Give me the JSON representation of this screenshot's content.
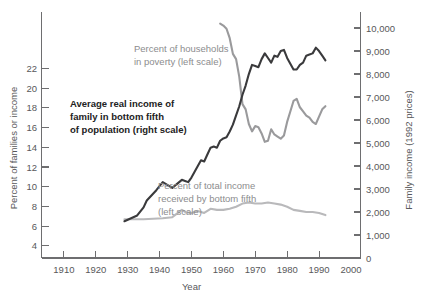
{
  "chart_data": {
    "type": "line",
    "title": "",
    "xlabel": "Year",
    "ylabel": "Percent of families or income",
    "ylabel_right": "Family income (1992 prices)",
    "xlim": [
      1903,
      2003
    ],
    "ylim": [
      0,
      23.5
    ],
    "ylim_right": [
      0,
      10700
    ],
    "grid": false,
    "legend": "annotations-inline",
    "x_ticks": [
      1910,
      1920,
      1930,
      1940,
      1950,
      1960,
      1970,
      1980,
      1990,
      2000
    ],
    "x_tick_labels": [
      "1910",
      "1920",
      "1930",
      "1940",
      "1950",
      "1960",
      "1970",
      "1980",
      "1990",
      "2000"
    ],
    "y_ticks_left": [
      4,
      6,
      8,
      10,
      12,
      14,
      16,
      18,
      20,
      22
    ],
    "y_tick_labels_left": [
      "4",
      "6",
      "8",
      "10",
      "12",
      "14",
      "16",
      "18",
      "20",
      "22"
    ],
    "y_ticks_right": [
      0,
      1000,
      2000,
      3000,
      4000,
      5000,
      6000,
      7000,
      8000,
      9000,
      10000
    ],
    "y_tick_labels_right": [
      "0",
      "1,000",
      "2,000",
      "3,000",
      "4,000",
      "5,000",
      "6,000",
      "7,000",
      "8,000",
      "9,000",
      "10,000"
    ],
    "series": [
      {
        "name": "Average real income of family in bottom fifth of population",
        "scale": "right",
        "units": "1992 dollars",
        "color": "#3a3a3c",
        "x": [
          1929,
          1933,
          1935,
          1936,
          1939,
          1941,
          1944,
          1947,
          1948,
          1949,
          1950,
          1951,
          1952,
          1953,
          1954,
          1955,
          1956,
          1957,
          1958,
          1959,
          1960,
          1961,
          1962,
          1963,
          1964,
          1965,
          1966,
          1967,
          1968,
          1969,
          1970,
          1971,
          1972,
          1973,
          1974,
          1975,
          1976,
          1977,
          1978,
          1979,
          1980,
          1981,
          1982,
          1983,
          1984,
          1985,
          1986,
          1987,
          1988,
          1989,
          1990,
          1991,
          1992
        ],
        "y": [
          1600,
          1850,
          2200,
          2500,
          2950,
          3300,
          3050,
          3400,
          3350,
          3300,
          3500,
          3750,
          4000,
          4250,
          4200,
          4500,
          4800,
          4850,
          4800,
          5100,
          5200,
          5250,
          5500,
          5800,
          6200,
          6600,
          7100,
          7500,
          8000,
          8400,
          8350,
          8300,
          8650,
          8900,
          8700,
          8500,
          8800,
          8750,
          9000,
          9050,
          8700,
          8450,
          8200,
          8200,
          8400,
          8500,
          8800,
          8850,
          8900,
          9150,
          9000,
          8800,
          8600
        ]
      },
      {
        "name": "Percent of households in poverty",
        "scale": "left",
        "units": "percent",
        "color": "#9a9a9c",
        "x": [
          1959,
          1960,
          1961,
          1962,
          1963,
          1964,
          1965,
          1966,
          1967,
          1968,
          1969,
          1970,
          1971,
          1972,
          1973,
          1974,
          1975,
          1976,
          1977,
          1978,
          1979,
          1980,
          1981,
          1982,
          1983,
          1984,
          1985,
          1986,
          1987,
          1988,
          1989,
          1990,
          1991,
          1992
        ],
        "y": [
          22.4,
          22.2,
          21.9,
          21.0,
          19.5,
          19.0,
          17.3,
          14.7,
          14.2,
          12.8,
          12.1,
          12.6,
          12.5,
          11.9,
          11.1,
          11.2,
          12.3,
          11.8,
          11.6,
          11.4,
          11.7,
          13.0,
          14.0,
          15.0,
          15.2,
          14.4,
          14.0,
          13.6,
          13.4,
          13.0,
          12.8,
          13.5,
          14.2,
          14.5
        ]
      },
      {
        "name": "Percent of total income received by bottom fifth",
        "scale": "left",
        "units": "percent",
        "color": "#b9b9bb",
        "x": [
          1929,
          1935,
          1941,
          1944,
          1947,
          1948,
          1950,
          1952,
          1954,
          1956,
          1958,
          1960,
          1962,
          1964,
          1966,
          1968,
          1970,
          1972,
          1974,
          1976,
          1978,
          1980,
          1982,
          1984,
          1986,
          1988,
          1990,
          1992
        ],
        "y": [
          3.7,
          3.7,
          3.8,
          3.9,
          4.6,
          4.4,
          4.3,
          4.5,
          4.3,
          4.7,
          4.6,
          4.6,
          4.7,
          4.9,
          5.2,
          5.3,
          5.2,
          5.2,
          5.3,
          5.2,
          5.1,
          4.9,
          4.6,
          4.5,
          4.4,
          4.4,
          4.3,
          4.1
        ]
      }
    ],
    "annotations": [
      {
        "name": "poverty-annotation",
        "lines": [
          "Percent of households",
          "in poverty (left scale)"
        ],
        "style": "gray"
      },
      {
        "name": "income-annotation",
        "lines": [
          "Average real income of",
          "family in bottom fifth",
          "of population (right scale)"
        ],
        "style": "dark-bold"
      },
      {
        "name": "share-annotation",
        "lines": [
          "Percent of total income",
          "received by bottom fifth",
          "(left scale)"
        ],
        "style": "gray"
      }
    ]
  }
}
